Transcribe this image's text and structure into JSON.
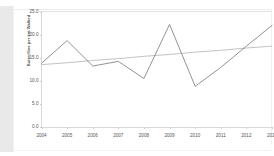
{
  "chart_data": {
    "type": "line",
    "title": "",
    "subtitle": "",
    "xlabel": "",
    "ylabel": "Butterflies per km Walked",
    "x": [
      2004,
      2005,
      2006,
      2007,
      2008,
      2009,
      2010,
      2011,
      2012,
      2013
    ],
    "xticklabels": [
      "2004",
      "2005",
      "2006",
      "2007",
      "2008",
      "2009",
      "2010",
      "2011",
      "2012",
      "2013"
    ],
    "yticks": [
      0.0,
      5.0,
      10.0,
      15.0,
      20.0,
      25.0
    ],
    "yticklabels": [
      "0.0",
      "5.0",
      "10.0",
      "15.0",
      "20.0",
      "25.0"
    ],
    "ylim": [
      0.0,
      25.0
    ],
    "xlim": [
      2004,
      2013
    ],
    "grid": false,
    "legend": "none",
    "series": [
      {
        "name": "Butterflies per km walked",
        "type": "line",
        "color": "#808080",
        "values": [
          13.8,
          18.7,
          13.2,
          14.2,
          10.5,
          22.2,
          8.8,
          12.9,
          17.5,
          22.0
        ]
      },
      {
        "name": "Linear trend",
        "type": "trendline",
        "color": "#9a9a9a",
        "values": [
          13.5,
          13.9,
          14.4,
          14.8,
          15.3,
          15.7,
          16.2,
          16.6,
          17.1,
          17.5
        ]
      }
    ],
    "annotations": []
  },
  "figure": {
    "background_color": "#ffffff",
    "axis_color": "#d9d9d9",
    "tick_label_color": "#555555",
    "axis_title_color": "#4a4a4a"
  }
}
